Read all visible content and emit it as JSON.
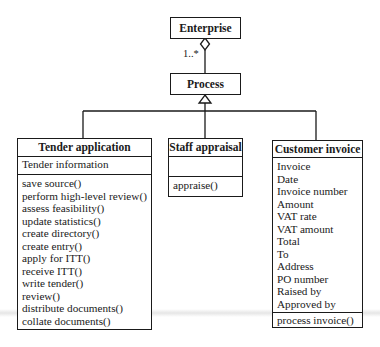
{
  "diagram": {
    "type": "UML class diagram",
    "classes": {
      "enterprise": {
        "name": "Enterprise"
      },
      "process": {
        "name": "Process"
      },
      "tender": {
        "name": "Tender application",
        "attributes": [
          "Tender information"
        ],
        "operations": [
          "save source()",
          "perform high-level review()",
          "assess feasibility()",
          "update statistics()",
          "create directory()",
          "create entry()",
          "apply for ITT()",
          "receive ITT()",
          "write tender()",
          "review()",
          "distribute documents()",
          "collate documents()"
        ]
      },
      "staff": {
        "name": "Staff appraisal",
        "attributes": [],
        "operations": [
          "appraise()"
        ]
      },
      "customer": {
        "name": "Customer invoice",
        "attributes": [
          "Invoice",
          "Date",
          "Invoice number",
          "Amount",
          "VAT rate",
          "VAT amount",
          "Total",
          "To",
          "Address",
          "PO number",
          "Raised by",
          "Approved by"
        ],
        "operations": [
          "process invoice()"
        ]
      }
    },
    "relationships": [
      {
        "type": "aggregation",
        "whole": "Enterprise",
        "part": "Process",
        "multiplicity": "1..*"
      },
      {
        "type": "generalization",
        "parent": "Process",
        "children": [
          "Tender application",
          "Staff appraisal",
          "Customer invoice"
        ]
      }
    ],
    "multiplicity_label": "1..*"
  }
}
